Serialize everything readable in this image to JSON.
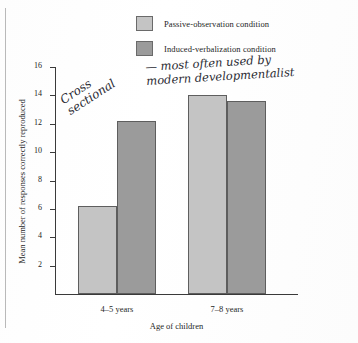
{
  "legend": {
    "items": [
      {
        "label": "Passive-observation condition",
        "color": "#c4c4c4",
        "swatch_name": "legend-swatch-passive"
      },
      {
        "label": "Induced-verbalization condition",
        "color": "#9b9b9b",
        "swatch_name": "legend-swatch-induced"
      }
    ]
  },
  "annotations": [
    {
      "name": "handwritten-note-cross-sectional",
      "lines": [
        "Cross",
        "sectional"
      ]
    },
    {
      "name": "handwritten-note-modern",
      "lines": [
        "— most often used by",
        "modern developmentalist"
      ]
    }
  ],
  "chart_data": {
    "type": "bar",
    "title": "",
    "xlabel": "Age of children",
    "ylabel": "Mean number of responses correctly reproduced",
    "categories": [
      "4–5 years",
      "7–8 years"
    ],
    "series": [
      {
        "name": "Passive-observation condition",
        "color": "#c4c4c4",
        "values": [
          6.2,
          14.0
        ]
      },
      {
        "name": "Induced-verbalization condition",
        "color": "#9b9b9b",
        "values": [
          12.2,
          13.6
        ]
      }
    ],
    "ylim": [
      0,
      16
    ],
    "yticks": [
      2,
      4,
      6,
      8,
      10,
      12,
      14,
      16
    ],
    "ytick_labels": [
      "2",
      "4",
      "6",
      "8",
      "10",
      "12",
      "14",
      "16"
    ],
    "grid": false,
    "legend_position": "top"
  }
}
